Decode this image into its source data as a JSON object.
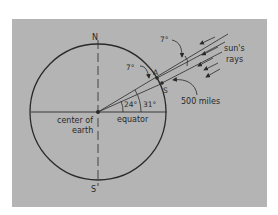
{
  "diagram": {
    "colors": {
      "background": "#b4b4b4",
      "ink": "#2a2a2a",
      "page": "#ffffff"
    },
    "labels": {
      "north": "N",
      "south": "S",
      "center": "center of",
      "center2": "earth",
      "equator": "equator",
      "point_a": "A",
      "point_s": "S",
      "angle_24": "24°",
      "angle_31": "31°",
      "angle_7_inner": "7°",
      "angle_7_outer": "7°",
      "distance": "500 miles",
      "rays_1": "sun's",
      "rays_2": "rays"
    }
  }
}
